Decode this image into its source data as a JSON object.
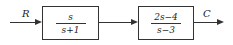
{
  "diagram": {
    "type": "block-diagram",
    "input": {
      "label": "R"
    },
    "output": {
      "label": "C"
    },
    "blocks": [
      {
        "numerator": "s",
        "denominator": "s+1"
      },
      {
        "numerator": "2s−4",
        "denominator": "s−3"
      }
    ],
    "edges": [
      {
        "from": "R",
        "to": "block1"
      },
      {
        "from": "block1",
        "to": "block2"
      },
      {
        "from": "block2",
        "to": "C"
      }
    ]
  }
}
